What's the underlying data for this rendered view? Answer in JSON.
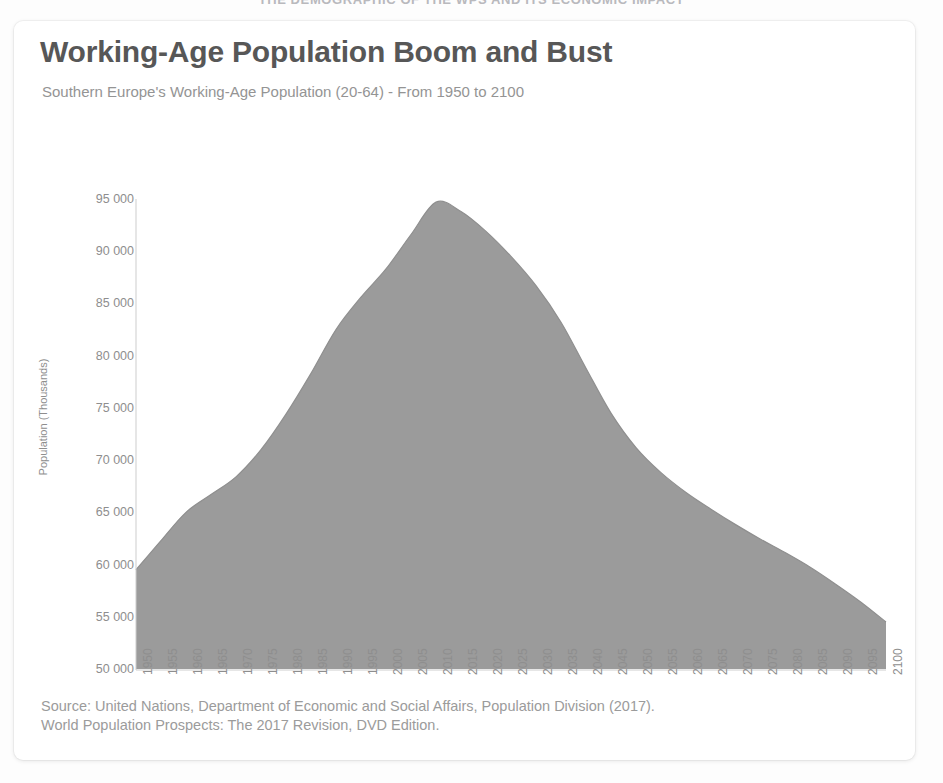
{
  "banner": {
    "text": "THE DEMOGRAPHIC OF THE WPS AND ITS ECONOMIC IMPACT"
  },
  "card": {
    "title": "Working-Age Population Boom and Bust",
    "subtitle": "Southern Europe's Working-Age Population (20-64) - From 1950 to 2100",
    "source_line_1": "Source: United Nations, Department of Economic and Social Affairs, Population Division (2017).",
    "source_line_2": "World Population Prospects: The 2017 Revision, DVD Edition."
  },
  "colors": {
    "area_fill": "#9b9b9b",
    "area_stroke": "#8f8f8f",
    "title": "#575757",
    "subtitle": "#949494",
    "axis_text": "#8e8e8e",
    "card_bg": "#ffffff",
    "page_bg": "#fdfdfd"
  },
  "chart_data": {
    "type": "area",
    "title": "Working-Age Population Boom and Bust",
    "subtitle": "Southern Europe's Working-Age Population (20-64) - From 1950 to 2100",
    "xlabel": "",
    "ylabel": "Population (Thousands)",
    "ylim": [
      50000,
      95000
    ],
    "ytick_step": 5000,
    "ytick_labels": [
      "50 000",
      "55 000",
      "60 000",
      "65 000",
      "70 000",
      "75 000",
      "80 000",
      "85 000",
      "90 000",
      "95 000"
    ],
    "ytick_values": [
      50000,
      55000,
      60000,
      65000,
      70000,
      75000,
      80000,
      85000,
      90000,
      95000
    ],
    "grid": false,
    "legend": false,
    "xlim": [
      1950,
      2100
    ],
    "xtick_rotation": 90,
    "categories": [
      "1950",
      "1955",
      "1960",
      "1965",
      "1970",
      "1975",
      "1980",
      "1985",
      "1990",
      "1995",
      "2000",
      "2005",
      "2010",
      "2015",
      "2020",
      "2025",
      "2030",
      "2035",
      "2040",
      "2045",
      "2050",
      "2055",
      "2060",
      "2065",
      "2070",
      "2075",
      "2080",
      "2085",
      "2090",
      "2095",
      "2100"
    ],
    "values": [
      59500,
      62300,
      65000,
      66700,
      68400,
      71000,
      74400,
      78300,
      82500,
      85600,
      88300,
      91600,
      94700,
      93800,
      91900,
      89500,
      86700,
      83200,
      78800,
      74500,
      71200,
      68800,
      66900,
      65300,
      63800,
      62400,
      61100,
      59700,
      58100,
      56400,
      54500
    ],
    "series": [
      {
        "name": "Working-Age Population (20-64)",
        "values": [
          59500,
          62300,
          65000,
          66700,
          68400,
          71000,
          74400,
          78300,
          82500,
          85600,
          88300,
          91600,
          94700,
          93800,
          91900,
          89500,
          86700,
          83200,
          78800,
          74500,
          71200,
          68800,
          66900,
          65300,
          63800,
          62400,
          61100,
          59700,
          58100,
          56400,
          54500
        ]
      }
    ],
    "peak": {
      "year": "2010",
      "value": 94700
    },
    "start": {
      "year": "1950",
      "value": 59500
    },
    "end": {
      "year": "2100",
      "value": 54500
    }
  }
}
